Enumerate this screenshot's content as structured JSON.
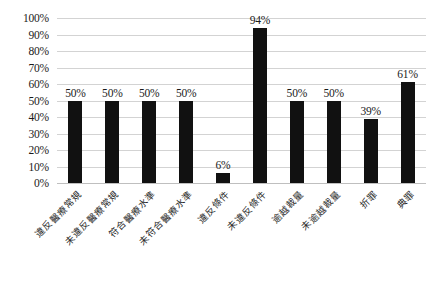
{
  "chart_data": {
    "type": "bar",
    "title": "",
    "subtitle": "",
    "xlabel": "",
    "ylabel": "",
    "ylim": [
      0,
      100
    ],
    "ytick_step": 10,
    "grid": true,
    "legend": false,
    "legend_position": "none",
    "bar_color": "#111111",
    "gridline_color": "#d3d3d3",
    "background_color": "#ffffff",
    "value_label_suffix": "%",
    "categories": [
      "違反醫療常規",
      "未違反醫療常規",
      "符合醫療水準",
      "未符合醫療水準",
      "違反條件",
      "未違反條件",
      "逾越裁量",
      "未逾越裁量",
      "折罪",
      "典罪"
    ],
    "values": [
      50,
      50,
      50,
      50,
      6,
      94,
      50,
      50,
      39,
      61
    ],
    "value_labels": [
      "50%",
      "50%",
      "50%",
      "50%",
      "6%",
      "94%",
      "50%",
      "50%",
      "39%",
      "61%"
    ],
    "ytick_labels": [
      "100%",
      "90%",
      "80%",
      "70%",
      "60%",
      "50%",
      "40%",
      "30%",
      "20%",
      "10%",
      "0%"
    ],
    "ytick_values": [
      100,
      90,
      80,
      70,
      60,
      50,
      40,
      30,
      20,
      10,
      0
    ]
  }
}
